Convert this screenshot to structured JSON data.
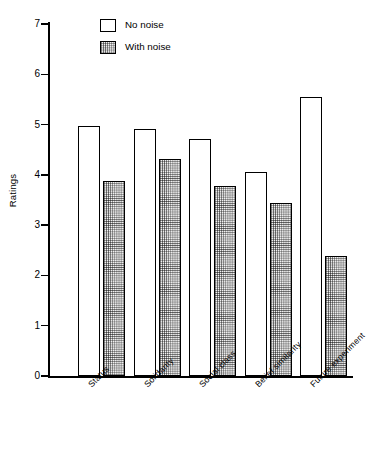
{
  "chart_data": {
    "type": "bar",
    "title": "",
    "xlabel": "",
    "ylabel": "Ratings",
    "ylim": [
      0,
      7
    ],
    "yticks": [
      "0",
      "1",
      "2",
      "3",
      "4",
      "5",
      "6",
      "7"
    ],
    "grid": false,
    "legend_position": "top-center",
    "categories": [
      "Status",
      "Solidarity",
      "Social class",
      "Belief similarity",
      "Future experiment"
    ],
    "series": [
      {
        "name": "No noise",
        "swatch": "white-empty-square",
        "values": [
          4.97,
          4.91,
          4.72,
          4.06,
          5.54
        ]
      },
      {
        "name": "With noise",
        "swatch": "stippled-square",
        "values": [
          3.88,
          4.32,
          3.78,
          3.45,
          2.38
        ]
      }
    ]
  },
  "legend": {
    "items": [
      {
        "label": "No noise"
      },
      {
        "label": "With noise"
      }
    ]
  },
  "colors": {
    "axis": "#000000",
    "bar_no_noise": "#ffffff",
    "bar_with_noise": "#f2f2f2",
    "outline": "#000000",
    "background": "#ffffff"
  }
}
